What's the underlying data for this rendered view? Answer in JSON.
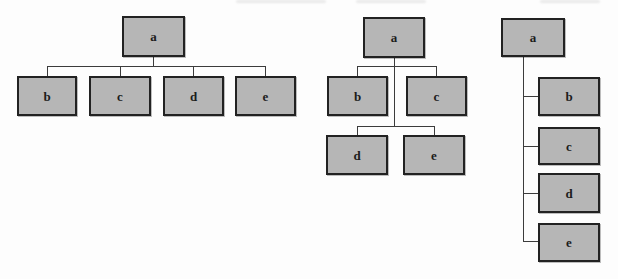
{
  "figure": {
    "tree": {
      "root": "a",
      "children": [
        "b",
        "c",
        "d",
        "e"
      ]
    }
  },
  "colors": {
    "page_bg": "#fdfdfd",
    "node_fill": "#b6b6b6",
    "node_border": "#222222",
    "connector": "#3c3c3c",
    "label": "#1c1c1c"
  },
  "diagrams": [
    {
      "layout": "horizontal-row",
      "root": "a",
      "children": [
        "b",
        "c",
        "d",
        "e"
      ],
      "nodes": {
        "a": "a",
        "b": "b",
        "c": "c",
        "d": "d",
        "e": "e"
      }
    },
    {
      "layout": "two-row",
      "root": "a",
      "children": [
        "b",
        "c",
        "d",
        "e"
      ],
      "nodes": {
        "a": "a",
        "b": "b",
        "c": "c",
        "d": "d",
        "e": "e"
      }
    },
    {
      "layout": "vertical-list",
      "root": "a",
      "children": [
        "b",
        "c",
        "d",
        "e"
      ],
      "nodes": {
        "a": "a",
        "b": "b",
        "c": "c",
        "d": "d",
        "e": "e"
      }
    }
  ]
}
